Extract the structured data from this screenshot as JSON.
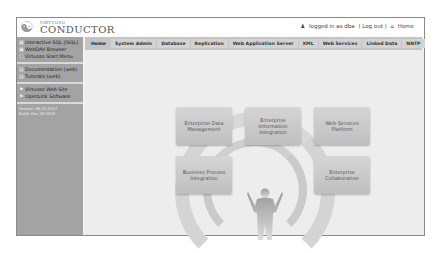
{
  "header": {
    "logo_small": "VIRTUOSO",
    "logo_big": "CONDUCTOR",
    "user_icon": "user-icon",
    "logged_in_text": "logged in as dba",
    "logout_link": "( Log out )",
    "home_icon": "home-icon",
    "home_link": "Home"
  },
  "sidebar": {
    "groups": [
      {
        "items": [
          {
            "label": "Interactive SQL (ISQL)",
            "icon": "sql-icon"
          },
          {
            "label": "WebDAV Browser",
            "icon": "folder-icon"
          },
          {
            "label": "Virtuoso Start Menu",
            "icon": "menu-icon"
          }
        ]
      },
      {
        "items": [
          {
            "label": "Documentation (web)",
            "icon": "book-icon"
          },
          {
            "label": "Tutorials (web)",
            "icon": "tutorial-icon"
          }
        ]
      },
      {
        "items": [
          {
            "label": "Virtuoso Web Site",
            "icon": "globe-icon"
          },
          {
            "label": "OpenLink Software",
            "icon": "globe-icon"
          }
        ]
      }
    ],
    "version": "Version: 06.01.3127",
    "build": "Build: Dec 29 2010"
  },
  "tabs": [
    {
      "label": "Home",
      "active": true
    },
    {
      "label": "System Admin"
    },
    {
      "label": "Database"
    },
    {
      "label": "Replication"
    },
    {
      "label": "Web Application Server"
    },
    {
      "label": "XML"
    },
    {
      "label": "Web Services"
    },
    {
      "label": "Linked Data"
    },
    {
      "label": "NNTP"
    }
  ],
  "diagram": {
    "boxes": [
      {
        "label": "Enterprise Data Management"
      },
      {
        "label": "Enterprise Information Integration"
      },
      {
        "label": "Web Services Platform"
      },
      {
        "label": "Business Process Integration"
      },
      {
        "label": "Enterprise Collaboration"
      }
    ]
  }
}
